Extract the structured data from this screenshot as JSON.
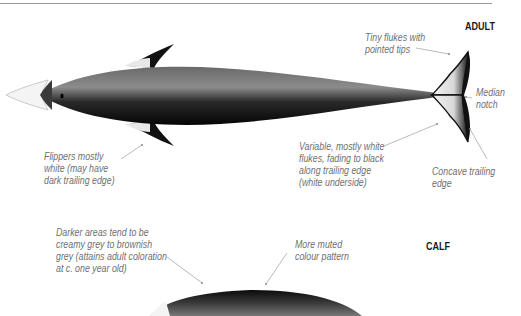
{
  "sections": {
    "adult": {
      "label": "ADULT",
      "annotations": {
        "flukes_tips": [
          "Tiny flukes with",
          "pointed tips"
        ],
        "median_notch": [
          "Median",
          "notch"
        ],
        "flukes_variable": [
          "Variable, mostly white",
          "flukes, fading to black",
          "along trailing edge",
          "(white underside)"
        ],
        "concave_edge": [
          "Concave trailing",
          "edge"
        ],
        "flippers": [
          "Flippers mostly",
          "white (may have",
          "dark trailing edge)"
        ]
      }
    },
    "calf": {
      "label": "CALF",
      "annotations": {
        "darker_areas": [
          "Darker areas tend to be",
          "creamy grey to brownish",
          "grey (attains adult coloration",
          "at c. one year old)"
        ],
        "muted": [
          "More muted",
          "colour pattern"
        ]
      }
    }
  },
  "colors": {
    "body_dark": "#111111",
    "body_mid": "#5a5a5a",
    "annotation_text": "#6f6f6f",
    "leader_line": "#a8a8a8"
  }
}
